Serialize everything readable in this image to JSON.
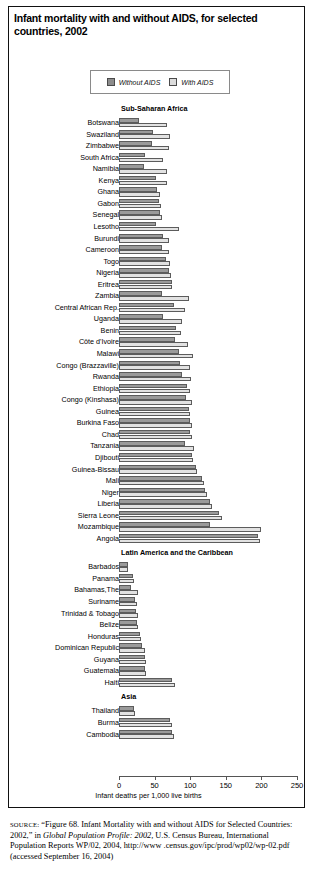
{
  "figure": {
    "title": "Infant mortality with and without AIDS, for selected countries, 2002",
    "legend": {
      "without_label": "Without AIDS",
      "with_label": "With AIDS",
      "without_color": "#9a9a9a",
      "with_color": "#e2e2e2"
    },
    "source_prefix": "SOURCE:",
    "source_part1": " “Figure 68. Infant Mortality with and without AIDS for Selected Countries: 2002,” in ",
    "source_italic": "Global Population Profile: 2002,",
    "source_part2": " U.S. Census Bureau, International Population Reports WP/02, 2004, http://www .census.gov/ipc/prod/wp02/wp-02.pdf (accessed September 16, 2004)"
  },
  "chart_data": {
    "type": "bar",
    "orientation": "horizontal",
    "title": "Infant mortality with and without AIDS, for selected countries, 2002",
    "xlabel": "Infant deaths per 1,000 live births",
    "ylabel": "",
    "xlim": [
      0,
      250
    ],
    "xticks": [
      0,
      50,
      100,
      150,
      200,
      250
    ],
    "grid": false,
    "legend_position": "top-center",
    "series_names": [
      "Without AIDS",
      "With AIDS"
    ],
    "groups": [
      {
        "name": "Sub-Saharan Africa",
        "categories": [
          "Botswana",
          "Swaziland",
          "Zimbabwe",
          "South Africa",
          "Namibia",
          "Kenya",
          "Ghana",
          "Gabon",
          "Senegal",
          "Lesotho",
          "Burundi",
          "Cameroon",
          "Togo",
          "Nigeria",
          "Eritrea",
          "Zambia",
          "Central African Rep.",
          "Uganda",
          "Benin",
          "Côte d'Ivoire",
          "Malawi",
          "Congo (Brazzaville)",
          "Rwanda",
          "Ethiopia",
          "Congo (Kinshasa)",
          "Guinea",
          "Burkina Faso",
          "Chad",
          "Tanzania",
          "Djibouti",
          "Guinea-Bissau",
          "Mali",
          "Niger",
          "Liberia",
          "Sierra Leone",
          "Mozambique",
          "Angola"
        ],
        "without_aids": [
          28,
          48,
          47,
          36,
          35,
          52,
          53,
          56,
          58,
          52,
          62,
          60,
          66,
          70,
          74,
          60,
          77,
          62,
          80,
          78,
          84,
          85,
          89,
          96,
          94,
          98,
          100,
          100,
          92,
          102,
          108,
          117,
          121,
          128,
          140,
          128,
          195
        ],
        "with_aids": [
          68,
          71,
          70,
          62,
          67,
          68,
          57,
          59,
          60,
          84,
          70,
          70,
          72,
          73,
          75,
          99,
          92,
          88,
          87,
          97,
          104,
          100,
          101,
          100,
          102,
          100,
          102,
          103,
          105,
          104,
          110,
          119,
          123,
          131,
          145,
          199,
          198
        ]
      },
      {
        "name": "Latin America and the Caribbean",
        "categories": [
          "Barbados",
          "Panama",
          "Bahamas,The",
          "Suriname",
          "Trinidad & Tobago",
          "Belize",
          "Honduras",
          "Dominican Republic",
          "Guyana",
          "Guatemala",
          "Haiti"
        ],
        "without_aids": [
          12,
          20,
          17,
          23,
          24,
          25,
          30,
          32,
          36,
          37,
          75
        ],
        "with_aids": [
          13,
          21,
          26,
          25,
          27,
          26,
          31,
          36,
          38,
          38,
          79
        ]
      },
      {
        "name": "Asia",
        "categories": [
          "Thailand",
          "Burma",
          "Cambodia"
        ],
        "without_aids": [
          21,
          72,
          75
        ],
        "with_aids": [
          23,
          74,
          77
        ]
      }
    ]
  }
}
